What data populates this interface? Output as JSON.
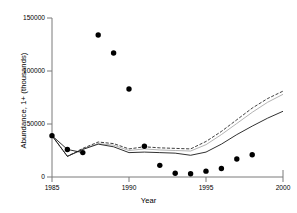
{
  "chart_data": {
    "type": "scatter",
    "title": "",
    "xlabel": "Year",
    "ylabel": "Abundance, 1+ (thousands)",
    "xlim": [
      1985,
      2000
    ],
    "ylim": [
      0,
      150000
    ],
    "xticks": [
      1985,
      1990,
      1995,
      2000
    ],
    "yticks": [
      0,
      50000,
      100000,
      150000
    ],
    "grid": false,
    "legend": "none",
    "x": [
      1985,
      1986,
      1987,
      1988,
      1989,
      1990,
      1991,
      1992,
      1993,
      1994,
      1995,
      1996,
      1997,
      1998
    ],
    "series": [
      {
        "name": "Observed abundance",
        "style": "markers",
        "marker": "filled-circle",
        "color": "#000000",
        "values": [
          39000,
          26000,
          23000,
          134000,
          117000,
          83000,
          29000,
          11000,
          3500,
          3000,
          5500,
          8000,
          17000,
          21000
        ]
      },
      {
        "name": "Model estimate (dashed)",
        "style": "dashed-line",
        "color": "#333333",
        "x": [
          1985,
          1986,
          1987,
          1988,
          1989,
          1990,
          1991,
          1992,
          1993,
          1994,
          1995,
          1996,
          1997,
          1998,
          1999,
          2000
        ],
        "values": [
          39000,
          19500,
          27000,
          33000,
          31500,
          26500,
          28500,
          27500,
          27000,
          26500,
          33500,
          43000,
          54000,
          65000,
          74000,
          81000
        ]
      },
      {
        "name": "Model estimate (grey)",
        "style": "thin-grey-line",
        "color": "#999999",
        "x": [
          1985,
          1986,
          1987,
          1988,
          1989,
          1990,
          1991,
          1992,
          1993,
          1994,
          1995,
          1996,
          1997,
          1998,
          1999,
          2000
        ],
        "values": [
          39000,
          19500,
          26500,
          31500,
          30000,
          25000,
          26500,
          25500,
          25000,
          24500,
          30500,
          40000,
          50500,
          61000,
          70500,
          78000
        ]
      },
      {
        "name": "Model estimate (solid)",
        "style": "solid-line",
        "color": "#000000",
        "x": [
          1985,
          1986,
          1987,
          1988,
          1989,
          1990,
          1991,
          1992,
          1993,
          1994,
          1995,
          1996,
          1997,
          1998,
          1999,
          2000
        ],
        "values": [
          39000,
          19500,
          26000,
          31000,
          28500,
          23000,
          23500,
          23000,
          22500,
          20500,
          23500,
          31000,
          40000,
          48000,
          55500,
          62000
        ]
      }
    ],
    "ytick_labels": [
      "0",
      "50000",
      "100000",
      "150000"
    ],
    "xtick_labels": [
      "1985",
      "1990",
      "1995",
      "2000"
    ]
  }
}
